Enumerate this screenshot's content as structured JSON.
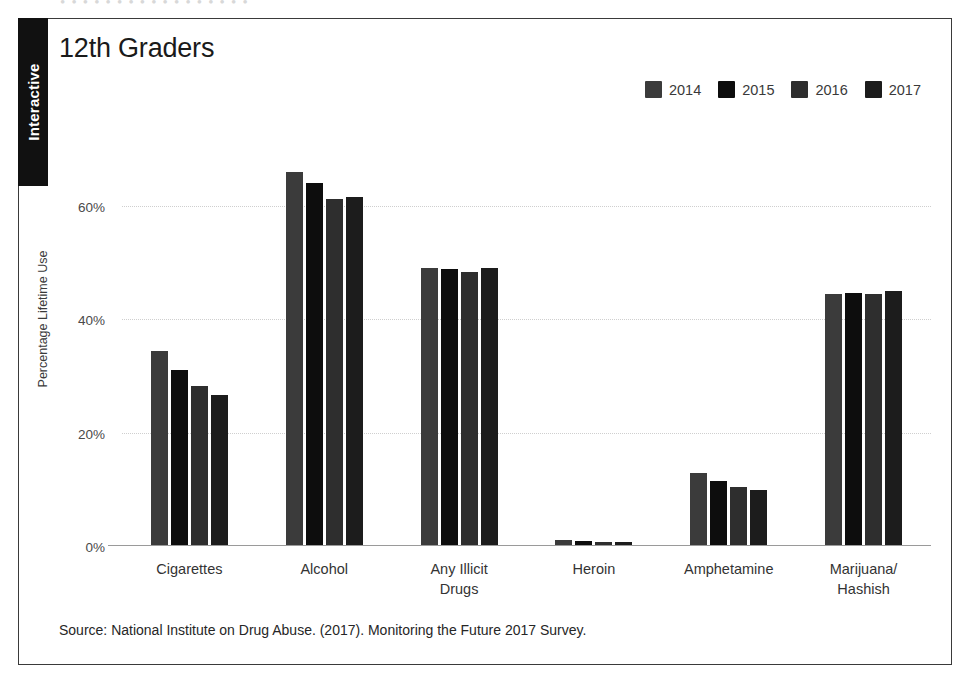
{
  "side_tab": {
    "label": "Interactive"
  },
  "bleed_text": "• • • • • • • • • • • • • • • • •",
  "figure": {
    "title": "12th Graders",
    "source": "Source: National Institute on Drug Abuse. (2017). Monitoring the Future 2017 Survey."
  },
  "colors": {
    "bar_2014": "#3b3b3b",
    "bar_2015": "#0d0d0d",
    "bar_2016": "#2e2e2e",
    "bar_2017": "#1c1c1c",
    "highlight_band": "#e9e9e9",
    "frame": "#3a3a3a",
    "tab_background": "#111111"
  },
  "chart_data": {
    "type": "bar",
    "title": "12th Graders",
    "xlabel": "",
    "ylabel": "Percentage Lifetime Use",
    "ylim": [
      0,
      70
    ],
    "yticks": [
      0,
      20,
      40,
      60
    ],
    "ytick_labels": [
      "0%",
      "20%",
      "40%",
      "60%"
    ],
    "grid": true,
    "legend_position": "top-right",
    "highlighted_category": "Any Illicit Drugs",
    "categories": [
      "Cigarettes",
      "Alcohol",
      "Any Illicit\nDrugs",
      "Heroin",
      "Amphetamine",
      "Marijuana/\nHashish"
    ],
    "series": [
      {
        "name": "2014",
        "color": "#3b3b3b",
        "values": [
          34.4,
          66.0,
          49.1,
          1.0,
          12.8,
          44.4
        ]
      },
      {
        "name": "2015",
        "color": "#0d0d0d",
        "values": [
          31.1,
          64.0,
          48.9,
          0.8,
          11.4,
          44.7
        ]
      },
      {
        "name": "2016",
        "color": "#2e2e2e",
        "values": [
          28.3,
          61.2,
          48.4,
          0.7,
          10.4,
          44.5
        ]
      },
      {
        "name": "2017",
        "color": "#1c1c1c",
        "values": [
          26.6,
          61.5,
          49.1,
          0.7,
          9.8,
          45.0
        ]
      }
    ]
  }
}
